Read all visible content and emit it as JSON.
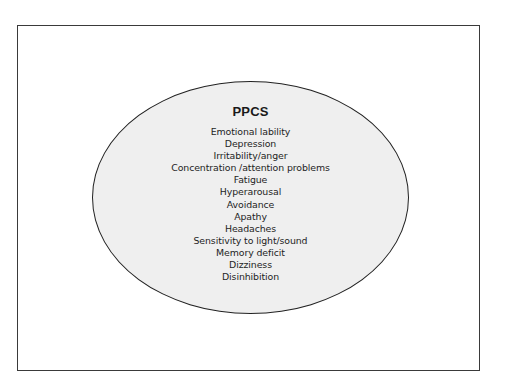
{
  "diagram": {
    "title": "PPCS",
    "items": [
      "Emotional lability",
      "Depression",
      "Irritability/anger",
      "Concentration /attention problems",
      "Fatigue",
      "Hyperarousal",
      "Avoidance",
      "Apathy",
      "Headaches",
      "Sensitivity to light/sound",
      "Memory deficit",
      "Dizziness",
      "Disinhibition"
    ],
    "colors": {
      "ellipse_fill": "#efefef",
      "outline": "#222222",
      "frame": "#3a3a3a",
      "text": "#1e1e1e"
    }
  }
}
